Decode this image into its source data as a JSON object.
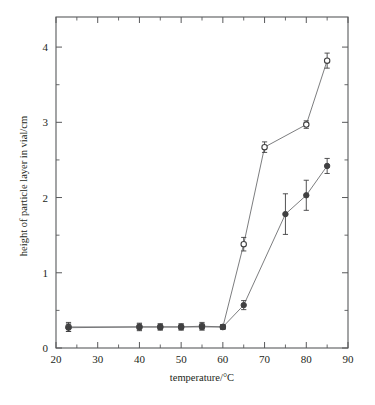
{
  "chart_data": {
    "type": "line",
    "title": "",
    "xlabel": "temperature/°C",
    "ylabel": "height of particle layer in vial/cm",
    "xlim": [
      20,
      90
    ],
    "ylim": [
      0,
      4.4
    ],
    "xticks": [
      20,
      30,
      40,
      50,
      60,
      70,
      80,
      90
    ],
    "xtick_labels": [
      "20",
      "30",
      "40",
      "50",
      "60",
      "70",
      "80",
      "90"
    ],
    "xticks_minor": [
      25,
      35,
      45,
      55,
      65,
      75,
      85
    ],
    "yticks": [
      0,
      1,
      2,
      3,
      4
    ],
    "ytick_labels": [
      "0",
      "1",
      "2",
      "3",
      "4"
    ],
    "yticks_minor": [
      0.5,
      1.5,
      2.5,
      3.5
    ],
    "grid": false,
    "legend": "none",
    "series": [
      {
        "name": "open-circle series",
        "marker": "open-circle",
        "x": [
          23,
          40,
          45,
          50,
          55,
          60,
          65,
          70,
          80,
          85
        ],
        "values": [
          0.28,
          0.28,
          0.28,
          0.28,
          0.29,
          0.28,
          1.38,
          2.67,
          2.97,
          3.82
        ],
        "yerr": [
          0.06,
          0.05,
          0.04,
          0.04,
          0.05,
          0.03,
          0.09,
          0.07,
          0.05,
          0.1
        ]
      },
      {
        "name": "filled-marker series",
        "marker": "filled-circle",
        "x": [
          23,
          40,
          45,
          50,
          55,
          60,
          65,
          75,
          80,
          85
        ],
        "values": [
          0.27,
          0.28,
          0.28,
          0.28,
          0.28,
          0.28,
          0.57,
          1.78,
          2.03,
          2.42
        ],
        "yerr": [
          0.05,
          0.04,
          0.04,
          0.04,
          0.04,
          0.03,
          0.06,
          0.27,
          0.2,
          0.1
        ]
      }
    ]
  },
  "colors": {
    "axis": "#58595b",
    "line": "#6d6e71",
    "marker": "#404041",
    "background": "#ffffff"
  }
}
